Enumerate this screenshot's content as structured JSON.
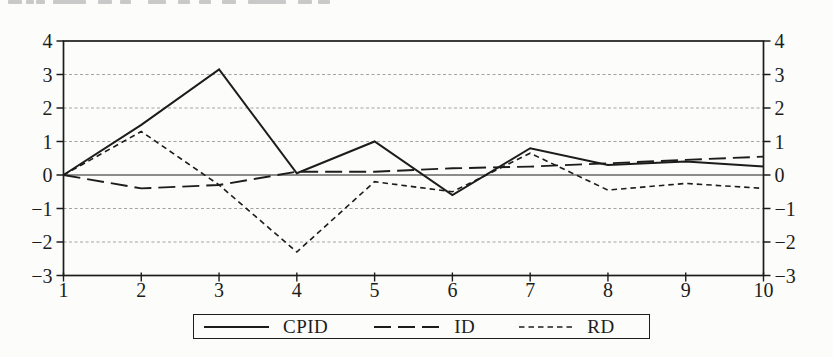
{
  "chart_data": {
    "type": "line",
    "title": "",
    "xlabel": "",
    "ylabel": "",
    "x": [
      1,
      2,
      3,
      4,
      5,
      6,
      7,
      8,
      9,
      10
    ],
    "series": [
      {
        "name": "CPID",
        "style": "solid",
        "values": [
          0,
          1.5,
          3.15,
          0.05,
          1.0,
          -0.6,
          0.8,
          0.3,
          0.4,
          0.25
        ]
      },
      {
        "name": "ID",
        "style": "long-dash",
        "values": [
          0,
          -0.4,
          -0.3,
          0.1,
          0.1,
          0.2,
          0.25,
          0.35,
          0.45,
          0.55
        ]
      },
      {
        "name": "RD",
        "style": "short-dash",
        "values": [
          0,
          1.3,
          -0.3,
          -2.3,
          -0.2,
          -0.5,
          0.65,
          -0.45,
          -0.25,
          -0.4
        ]
      }
    ],
    "xlim": [
      1,
      10
    ],
    "ylim": [
      -3,
      4
    ],
    "x_ticks": [
      1,
      2,
      3,
      4,
      5,
      6,
      7,
      8,
      9,
      10
    ],
    "y_ticks": [
      4,
      3,
      2,
      1,
      0,
      -1,
      -2,
      -3
    ],
    "gridlines_at": [
      3,
      2,
      1,
      -1,
      -2
    ],
    "zero_line": true,
    "dual_y_axis": true,
    "grid_on": true,
    "legend_position": "bottom",
    "line_color": "#1c1c1c",
    "grid_color": "#a3a3a3",
    "background": "#fcfcfa"
  }
}
